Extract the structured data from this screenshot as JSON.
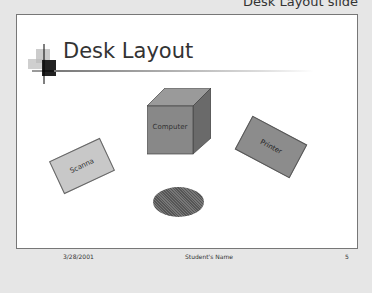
{
  "caption": "Desk Layout slide",
  "slide": {
    "title": "Desk Layout",
    "objects": {
      "computer": "Computer",
      "scanner": "Scanna",
      "printer": "Printer",
      "disk": ""
    },
    "footer": {
      "date": "3/28/2001",
      "name": "Student's Name",
      "page": "5"
    }
  }
}
